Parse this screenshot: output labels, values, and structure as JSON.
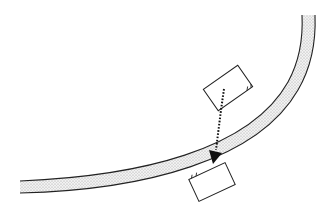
{
  "diagram": {
    "colors": {
      "background": "#ffffff",
      "stroke": "#222222",
      "road_fill": "#e4e4e4",
      "arrow": "#111111"
    },
    "road": {
      "type": "curved-band",
      "pattern": "stippled"
    },
    "objects": [
      {
        "id": "start-box",
        "shape": "rectangle",
        "rotation_deg": -35
      },
      {
        "id": "end-box",
        "shape": "rectangle",
        "rotation_deg": -25
      }
    ],
    "arrow": {
      "style": "dotted",
      "from": "start-box",
      "to": "end-box"
    }
  }
}
